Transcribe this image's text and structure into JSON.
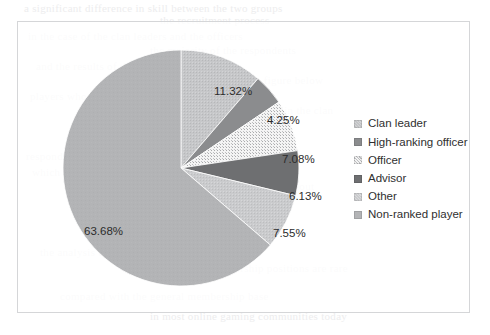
{
  "chart_data": {
    "type": "pie",
    "title": "",
    "categories": [
      "Clan leader",
      "High-ranking officer",
      "Officer",
      "Advisor",
      "Other",
      "Non-ranked player"
    ],
    "values": [
      11.32,
      4.25,
      7.08,
      6.13,
      7.55,
      63.68
    ],
    "value_labels": [
      "11.32%",
      "4.25%",
      "7.08%",
      "6.13%",
      "7.55%",
      "63.68%"
    ],
    "unit": "%",
    "legend_position": "right",
    "grid": false,
    "start_angle_deg": 0,
    "direction": "clockwise",
    "colors": [
      "#c3c4c6",
      "#8b8c8e",
      "#f2f2f2",
      "#6e6f71",
      "#c9cacc",
      "#b3b4b6"
    ],
    "patterns": [
      "stipple-light",
      "solid",
      "dots-sparse",
      "solid",
      "stipple-light",
      "solid"
    ]
  },
  "frame": {
    "border_color": "#d5d6d8",
    "background": "#ffffff"
  },
  "legend": {
    "items": [
      {
        "label": "Clan leader",
        "color": "#c3c4c6"
      },
      {
        "label": "High-ranking officer",
        "color": "#8b8c8e"
      },
      {
        "label": "Officer",
        "color": "#f2f2f2"
      },
      {
        "label": "Advisor",
        "color": "#6e6f71"
      },
      {
        "label": "Other",
        "color": "#c9cacc"
      },
      {
        "label": "Non-ranked player",
        "color": "#b3b4b6"
      }
    ]
  },
  "labels": [
    {
      "text": "11.32%",
      "left": 196,
      "top": 63
    },
    {
      "text": "4.25%",
      "left": 249,
      "top": 92
    },
    {
      "text": "7.08%",
      "left": 264,
      "top": 131
    },
    {
      "text": "6.13%",
      "left": 271,
      "top": 168
    },
    {
      "text": "7.55%",
      "left": 255,
      "top": 205
    },
    {
      "text": "63.68%",
      "left": 66,
      "top": 203
    }
  ],
  "background_text": [
    {
      "text": "a significant difference in skill between the two groups",
      "left": 24,
      "top": 2
    },
    {
      "text": "the recruitment process",
      "left": 160,
      "top": 14
    },
    {
      "text": "in the case of the clan leaders and the officers",
      "left": 28,
      "top": 30
    },
    {
      "text": "the majority of the respondents",
      "left": 150,
      "top": 44
    },
    {
      "text": "and the results of the survey are presented",
      "left": 36,
      "top": 60
    },
    {
      "text": "as shown in the figure below",
      "left": 188,
      "top": 74
    },
    {
      "text": "players who participate in clan activities",
      "left": 30,
      "top": 90
    },
    {
      "text": "the distribution of roles within the clan",
      "left": 150,
      "top": 104
    },
    {
      "text": "respondents reported holding no formal rank",
      "left": 26,
      "top": 150
    },
    {
      "text": "which suggests that most members remain",
      "left": 32,
      "top": 166
    },
    {
      "text": "non-ranked players throughout",
      "left": 170,
      "top": 180
    },
    {
      "text": "the analysis of the data collected",
      "left": 40,
      "top": 246
    },
    {
      "text": "indicates that leadership positions are rare",
      "left": 150,
      "top": 262
    },
    {
      "text": "compared with the general membership base",
      "left": 60,
      "top": 290
    },
    {
      "text": "in most online gaming communities today",
      "left": 150,
      "top": 310
    }
  ]
}
